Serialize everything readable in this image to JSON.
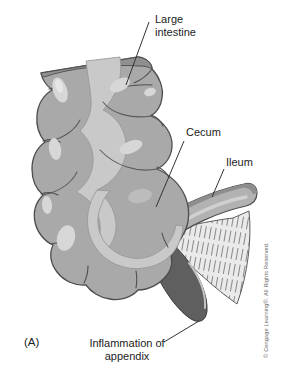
{
  "figure": {
    "panel_label": "(A)",
    "labels": {
      "large_intestine": "Large intestine",
      "cecum": "Cecum",
      "ileum": "Ileum",
      "inflammation": "Inflammation of appendix"
    },
    "copyright": "© Cengage Learning®. All Rights Reserved.",
    "colors": {
      "background": "#ffffff",
      "intestine_body": "#a9a9a9",
      "taenia_band": "#c9c9c9",
      "highlight": "#d7d7d7",
      "outline": "#4d4d4d",
      "cut_surface": "#8f8f8f",
      "ileum_body": "#b2b2b2",
      "mesoappendix_bg": "#eaeaea",
      "appendix_inflamed": "#5f5f5f",
      "label_text": "#1c1c1c"
    }
  }
}
